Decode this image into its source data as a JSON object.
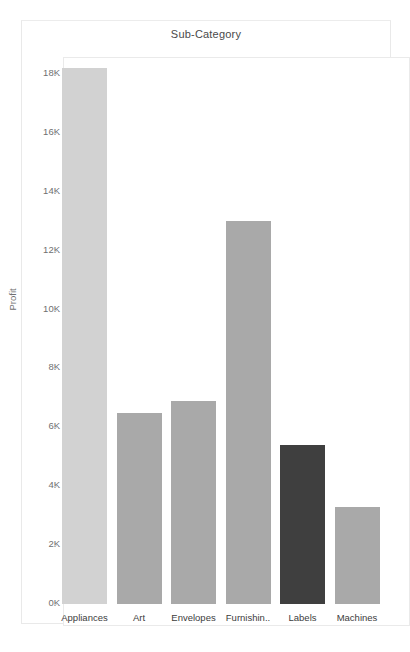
{
  "chart": {
    "title": "Sub-Category",
    "y_axis_title": "Profit"
  },
  "chart_data": {
    "type": "bar",
    "title": "Sub-Category",
    "xlabel": "",
    "ylabel": "Profit",
    "ylim": [
      0,
      18800
    ],
    "grid": false,
    "legend": "none",
    "ytick_labels": [
      "0K",
      "2K",
      "4K",
      "6K",
      "8K",
      "10K",
      "12K",
      "14K",
      "16K",
      "18K"
    ],
    "ytick_values": [
      0,
      2000,
      4000,
      6000,
      8000,
      10000,
      12000,
      14000,
      16000,
      18000
    ],
    "categories": [
      "Appliances",
      "Art",
      "Envelopes",
      "Furnishin..",
      "Labels",
      "Machines"
    ],
    "values": [
      18200,
      6500,
      6900,
      13000,
      5400,
      3300
    ],
    "bar_colors": [
      "#d2d2d2",
      "#a9a9a9",
      "#a9a9a9",
      "#a9a9a9",
      "#3f3f3f",
      "#a9a9a9"
    ]
  },
  "colors": {
    "bar_light": "#d2d2d2",
    "bar_medium": "#a9a9a9",
    "bar_dark": "#3f3f3f",
    "frame_border": "#eaeaea",
    "tick_text": "#707070",
    "label_text": "#3c3c3c"
  }
}
